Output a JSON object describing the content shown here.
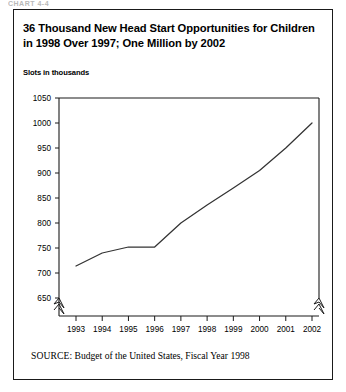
{
  "top_fragment": {
    "text": "CHART 4-4"
  },
  "figure": {
    "title": "36 Thousand New Head Start Opportunities for Children in 1998 Over 1997; One Million by 2002",
    "axis_title": "Slots in thousands",
    "source_label": "SOURCE:",
    "source_text": "Budget of the United States, Fiscal Year 1998"
  },
  "chart_data": {
    "type": "line",
    "title": "36 Thousand New Head Start Opportunities for Children in 1998 Over 1997; One Million by 2002",
    "xlabel": "",
    "ylabel": "Slots in thousands",
    "x": [
      1993,
      1994,
      1995,
      1996,
      1997,
      1998,
      1999,
      2000,
      2001,
      2002
    ],
    "categories": [
      "1993",
      "1994",
      "1995",
      "1996",
      "1997",
      "1998",
      "1999",
      "2000",
      "2001",
      "2002"
    ],
    "values": [
      714,
      740,
      752,
      752,
      800,
      836,
      870,
      905,
      950,
      1000
    ],
    "series": [
      {
        "name": "Head Start slots",
        "values": [
          714,
          740,
          752,
          752,
          800,
          836,
          870,
          905,
          950,
          1000
        ]
      }
    ],
    "ylim": [
      650,
      1050
    ],
    "yticks": [
      650,
      700,
      750,
      800,
      850,
      900,
      950,
      1000,
      1050
    ],
    "ytick_labels": [
      "650",
      "700",
      "750",
      "800",
      "850",
      "900",
      "950",
      "1000",
      "1050"
    ],
    "xticks": [
      1993,
      1994,
      1995,
      1996,
      1997,
      1998,
      1999,
      2000,
      2001,
      2002
    ],
    "xtick_labels": [
      "1993",
      "1994",
      "1995",
      "1996",
      "1997",
      "1998",
      "1999",
      "2000",
      "2001",
      "2002"
    ],
    "grid": false,
    "legend": "none",
    "axis_break": "y-axis broken below 650 (zigzag marks on left and right frame edges)",
    "line_color": "#333333"
  },
  "colors": {
    "frame": "#1a1a1a",
    "line": "#333333",
    "text": "#000000",
    "background": "#ffffff"
  }
}
